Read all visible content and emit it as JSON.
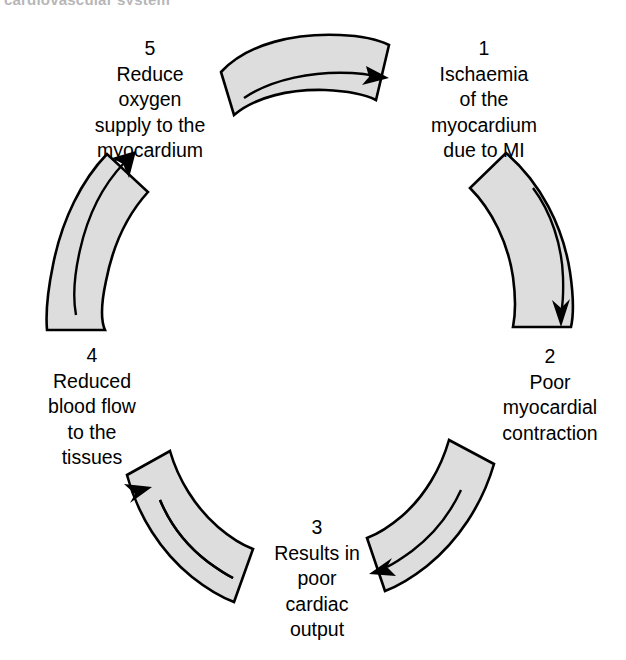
{
  "page": {
    "clipped_heading_fragment": "cardiovascular system"
  },
  "diagram": {
    "type": "cycle",
    "direction": "clockwise",
    "step_count": 5,
    "band_fill_color": "#dddddd",
    "band_stroke_color": "#000000",
    "background_color": "#ffffff",
    "steps": [
      {
        "number": "1",
        "lines": [
          "Ischaemia",
          "of the",
          "myocardium",
          "due to MI"
        ],
        "position": "top-right"
      },
      {
        "number": "2",
        "lines": [
          "Poor",
          "myocardial",
          "contraction"
        ],
        "position": "right"
      },
      {
        "number": "3",
        "lines": [
          "Results in",
          "poor",
          "cardiac",
          "output"
        ],
        "position": "bottom"
      },
      {
        "number": "4",
        "lines": [
          "Reduced",
          "blood flow",
          "to the",
          "tissues"
        ],
        "position": "left"
      },
      {
        "number": "5",
        "lines": [
          "Reduce",
          "oxygen",
          "supply to the",
          "myocardium"
        ],
        "position": "top-left"
      }
    ],
    "arrows": [
      {
        "name": "arrow-top",
        "from_step": "5",
        "to_step": "1",
        "points": "right"
      },
      {
        "name": "arrow-right",
        "from_step": "1",
        "to_step": "2",
        "points": "down"
      },
      {
        "name": "arrow-bottom-right",
        "from_step": "2",
        "to_step": "3",
        "points": "left-down"
      },
      {
        "name": "arrow-bottom-left",
        "from_step": "3",
        "to_step": "4",
        "points": "up-left"
      },
      {
        "name": "arrow-left",
        "from_step": "4",
        "to_step": "5",
        "points": "up-right"
      }
    ]
  }
}
